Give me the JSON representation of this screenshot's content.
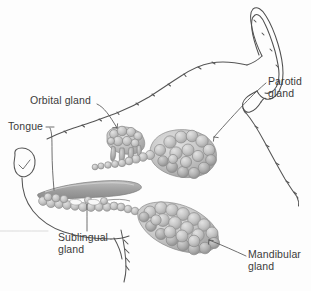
{
  "figure": {
    "type": "anatomical-illustration",
    "style": "pencil line drawing with gray shaded glands",
    "background_color": "#fdfdfd",
    "ink_color": "#4a4a4a",
    "gland_fill_light": "#cfcfcf",
    "gland_fill_mid": "#b8b8b8",
    "gland_fill_dark": "#9a9a9a",
    "gland_outline": "#8b8b8b",
    "label_color": "#3b3b3b",
    "leader_color": "#555555"
  },
  "labels": {
    "orbital": {
      "line1": "Orbital gland"
    },
    "tongue": {
      "line1": "Tongue"
    },
    "parotid": {
      "line1": "Parotid",
      "line2": "gland"
    },
    "sublingual": {
      "line1": "Sublingual",
      "line2": "gland"
    },
    "mandibular": {
      "line1": "Mandibular",
      "line2": "gland"
    }
  },
  "structures": [
    {
      "name": "orbital-gland",
      "label": "Orbital gland"
    },
    {
      "name": "parotid-gland",
      "label": "Parotid gland"
    },
    {
      "name": "mandibular-gland",
      "label": "Mandibular gland"
    },
    {
      "name": "sublingual-gland",
      "label": "Sublingual gland"
    },
    {
      "name": "tongue",
      "label": "Tongue"
    }
  ]
}
